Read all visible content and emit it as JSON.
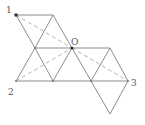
{
  "diagram": {
    "type": "geometry-net",
    "labels": {
      "p1": "1",
      "p2": "2",
      "p3": "3",
      "o": "O"
    },
    "vertices": {
      "p1": [
        16,
        15
      ],
      "a": [
        53,
        15
      ],
      "b": [
        35,
        48
      ],
      "o": [
        72,
        48
      ],
      "c": [
        110,
        48
      ],
      "p2": [
        16,
        81
      ],
      "d": [
        53,
        81
      ],
      "e": [
        91,
        81
      ],
      "p3": [
        128,
        81
      ],
      "f": [
        110,
        114
      ]
    },
    "colors": {
      "edge": "#6e6e6e",
      "dashed": "#b4b4b4",
      "label": "#555555"
    }
  }
}
